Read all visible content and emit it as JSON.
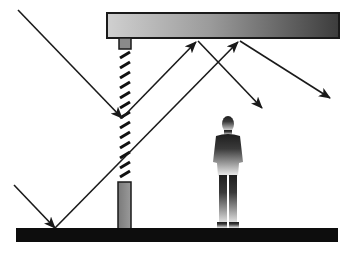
{
  "diagram": {
    "type": "light-reflection-illustration",
    "colors": {
      "ray": "#1a1a1a",
      "ceiling_light": "#c8c8c8",
      "ceiling_dark": "#4a4a4a",
      "floor": "#0d0d0d",
      "post": "#8a8a8a",
      "person_top": "#1e1e1e",
      "person_bottom": "#e8e8e8"
    },
    "elements": [
      {
        "name": "ceiling",
        "x": 107,
        "y": 13,
        "w": 232,
        "h": 25
      },
      {
        "name": "ceiling-mount",
        "x": 119,
        "y": 38,
        "w": 12,
        "h": 11
      },
      {
        "name": "hatched-panel",
        "x": 119,
        "y": 50,
        "w": 12,
        "h": 126
      },
      {
        "name": "lower-post",
        "x": 118,
        "y": 182,
        "w": 13,
        "h": 47
      },
      {
        "name": "floor",
        "x": 16,
        "y": 228,
        "w": 322,
        "h": 14
      },
      {
        "name": "person",
        "cx": 228,
        "top": 116,
        "bottom": 229
      }
    ],
    "rays": [
      {
        "name": "ray-incident-upper",
        "points": [
          [
            18,
            10
          ],
          [
            122,
            118
          ]
        ],
        "arrow": true
      },
      {
        "name": "ray-reflect-to-ceiling-1",
        "points": [
          [
            122,
            118
          ],
          [
            198,
            41
          ]
        ],
        "arrow": true
      },
      {
        "name": "ray-reflect-down-1",
        "points": [
          [
            198,
            41
          ],
          [
            262,
            108
          ]
        ],
        "arrow": true
      },
      {
        "name": "ray-incident-lower",
        "points": [
          [
            14,
            185
          ],
          [
            55,
            228
          ]
        ],
        "arrow": true
      },
      {
        "name": "ray-reflect-to-ceiling-2",
        "points": [
          [
            55,
            228
          ],
          [
            240,
            41
          ]
        ],
        "arrow": true
      },
      {
        "name": "ray-reflect-down-2",
        "points": [
          [
            240,
            41
          ],
          [
            330,
            98
          ]
        ],
        "arrow": true
      }
    ]
  }
}
